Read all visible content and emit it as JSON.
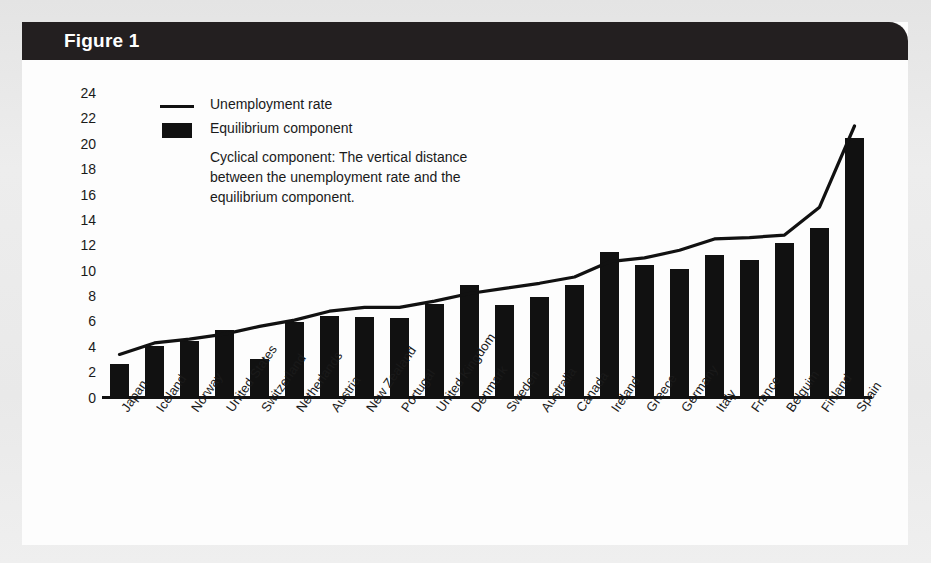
{
  "figure": {
    "title": "Figure 1",
    "header_color": "#231f20",
    "card_color": "#fdfdfd",
    "ink_color": "#111111"
  },
  "legend": {
    "line_label": "Unemployment rate",
    "bar_label": "Equilibrium component",
    "note": "Cyclical component: The vertical distance between the unemployment rate and the equilibrium component."
  },
  "background_text": {
    "g1": "the aggregate economy.",
    "g2": "in the economy",
    "g3": "Aggregate Supply",
    "g4": "equilibrium supply of the total output changes as both prices and output change together in the short run. The short-run aggregate supply curve is upward sloping.",
    "g5": "actual and equilibrium",
    "g6": "the cyclical component of the"
  },
  "chart_data": {
    "type": "bar",
    "title": "Figure 1",
    "xlabel": "",
    "ylabel": "",
    "ylim": [
      0,
      24
    ],
    "yticks": [
      0,
      2,
      4,
      6,
      8,
      10,
      12,
      14,
      16,
      18,
      20,
      22,
      24
    ],
    "grid": false,
    "legend_position": "upper-left",
    "categories": [
      "Japan",
      "Iceland",
      "Norway",
      "United States",
      "Switzerland",
      "Netherlands",
      "Austria",
      "New Zealand",
      "Portugal",
      "United Kingdom",
      "Denmark",
      "Sweden",
      "Australia",
      "Canada",
      "Ireland",
      "Greece",
      "Germany",
      "Italy",
      "France",
      "Belguim",
      "Finland",
      "Spain"
    ],
    "series": [
      {
        "name": "Equilibrium component",
        "type": "bar",
        "values": [
          2.7,
          4.1,
          4.5,
          5.4,
          3.1,
          6.0,
          6.5,
          6.4,
          6.3,
          7.4,
          8.9,
          7.3,
          8.0,
          8.9,
          11.5,
          10.5,
          10.2,
          11.3,
          10.9,
          12.2,
          13.4,
          20.5
        ]
      },
      {
        "name": "Unemployment rate",
        "type": "line",
        "values": [
          3.4,
          4.3,
          4.6,
          5.0,
          5.6,
          6.1,
          6.8,
          7.1,
          7.1,
          7.6,
          8.2,
          8.6,
          9.0,
          9.5,
          10.7,
          11.0,
          11.6,
          12.5,
          12.6,
          12.8,
          15.0,
          21.4
        ]
      }
    ]
  }
}
